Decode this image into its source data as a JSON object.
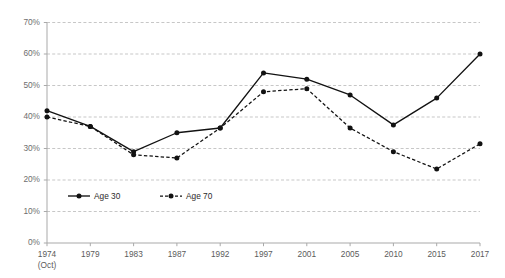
{
  "chart_data": {
    "type": "line",
    "title": "",
    "subtitle": "",
    "xlabel": "",
    "ylabel": "",
    "categories": [
      "1974",
      "1979",
      "1983",
      "1987",
      "1992",
      "1997",
      "2001",
      "2005",
      "2010",
      "2015",
      "2017"
    ],
    "category_sublabels": [
      "(Oct)",
      "",
      "",
      "",
      "",
      "",
      "",
      "",
      "",
      "",
      ""
    ],
    "series": [
      {
        "name": "Age 30",
        "style": "solid",
        "marker": "circle",
        "color": "#121212",
        "values": [
          42,
          37,
          29,
          35,
          36.5,
          54,
          52,
          47,
          37.5,
          46,
          60
        ]
      },
      {
        "name": "Age 70",
        "style": "dashed",
        "marker": "circle",
        "color": "#121212",
        "values": [
          40,
          37,
          28,
          27,
          36.5,
          48,
          49,
          36.5,
          29,
          23.5,
          31.5
        ]
      }
    ],
    "ylim": [
      0,
      70
    ],
    "ytick_step": 10,
    "ytick_labels": [
      "0%",
      "10%",
      "20%",
      "30%",
      "40%",
      "50%",
      "60%",
      "70%"
    ],
    "grid": true,
    "grid_axis": "y",
    "grid_color": "#b9b9b9",
    "legend_position": "inside-lower-left",
    "legend_entries": [
      "Age 30",
      "Age 70"
    ],
    "axis_color": "#a9a9a9",
    "background_color": "#ffffff"
  },
  "legend": {
    "items": [
      {
        "label": "Age 30"
      },
      {
        "label": "Age 70"
      }
    ]
  }
}
